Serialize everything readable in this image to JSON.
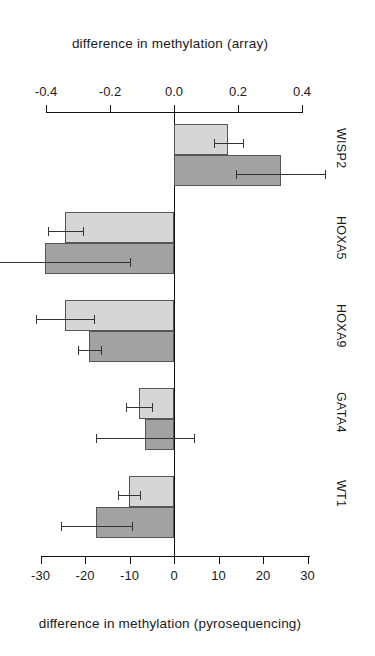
{
  "figure": {
    "top_axis_title": "difference in methylation (array)",
    "bottom_axis_title": "difference in methylation (pyrosequencing)"
  },
  "chart_data": {
    "type": "bar",
    "orientation": "horizontal",
    "title": "",
    "categories": [
      "WISP2",
      "HOXA5",
      "HOXA9",
      "GATA4",
      "WT1"
    ],
    "series": [
      {
        "name": "array",
        "style": "light-gray",
        "color": "#d6d6d6",
        "axis": "top",
        "values": [
          0.17,
          -0.34,
          -0.34,
          -0.11,
          -0.14
        ],
        "errors": [
          0.045,
          0.055,
          0.09,
          0.04,
          0.035
        ]
      },
      {
        "name": "pyrosequencing",
        "style": "dark-gray",
        "color": "#a2a2a2",
        "axis": "bottom",
        "values": [
          24.0,
          -29.0,
          -19.0,
          -6.5,
          -17.5
        ],
        "errors": [
          10.0,
          19.0,
          2.6,
          11.0,
          8.0
        ]
      }
    ],
    "top_axis": {
      "label": "difference in methylation (array)",
      "ticks": [
        "-0.4",
        "-0.2",
        "0.0",
        "0.2",
        "0.4"
      ],
      "tick_values": [
        -0.4,
        -0.2,
        0.0,
        0.2,
        0.4
      ],
      "range": [
        -0.44,
        0.44
      ]
    },
    "bottom_axis": {
      "label": "difference in methylation (pyrosequencing)",
      "ticks": [
        "-30",
        "-20",
        "-10",
        "0",
        "10",
        "20",
        "30"
      ],
      "tick_values": [
        -30,
        -20,
        -10,
        0,
        10,
        20,
        30
      ],
      "range": [
        -41,
        41
      ]
    },
    "grid": false,
    "legend": "none",
    "category_labels_position": "right"
  }
}
